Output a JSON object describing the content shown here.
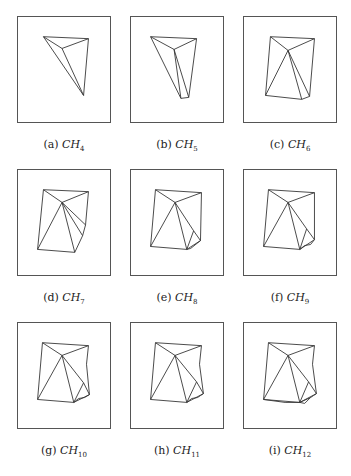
{
  "figure": {
    "panels": [
      {
        "label": "(a)",
        "symbol": "CH",
        "sub": "4",
        "vertices": [
          [
            26,
            20
          ],
          [
            72,
            22
          ],
          [
            45,
            32
          ],
          [
            67,
            80
          ]
        ],
        "edges": [
          [
            0,
            1
          ],
          [
            0,
            2
          ],
          [
            1,
            2
          ],
          [
            0,
            3
          ],
          [
            2,
            3
          ],
          [
            1,
            3
          ]
        ]
      },
      {
        "label": "(b)",
        "symbol": "CH",
        "sub": "5",
        "vertices": [
          [
            20,
            20
          ],
          [
            67,
            22
          ],
          [
            44,
            33
          ],
          [
            59,
            82
          ],
          [
            51,
            83
          ]
        ],
        "edges": [
          [
            0,
            1
          ],
          [
            0,
            2
          ],
          [
            1,
            2
          ],
          [
            0,
            4
          ],
          [
            2,
            4
          ],
          [
            1,
            3
          ],
          [
            3,
            4
          ],
          [
            2,
            3
          ]
        ]
      },
      {
        "label": "(c)",
        "symbol": "CH",
        "sub": "6",
        "vertices": [
          [
            27,
            20
          ],
          [
            72,
            22
          ],
          [
            45,
            34
          ],
          [
            22,
            80
          ],
          [
            59,
            84
          ],
          [
            67,
            81
          ]
        ],
        "edges": [
          [
            0,
            1
          ],
          [
            0,
            2
          ],
          [
            1,
            2
          ],
          [
            0,
            3
          ],
          [
            2,
            3
          ],
          [
            3,
            4
          ],
          [
            2,
            4
          ],
          [
            1,
            5
          ],
          [
            5,
            4
          ],
          [
            2,
            5
          ]
        ]
      },
      {
        "label": "(d)",
        "symbol": "CH",
        "sub": "7",
        "vertices": [
          [
            26,
            20
          ],
          [
            72,
            22
          ],
          [
            45,
            33
          ],
          [
            20,
            81
          ],
          [
            58,
            84
          ],
          [
            66,
            67
          ],
          [
            69,
            56
          ]
        ],
        "edges": [
          [
            0,
            1
          ],
          [
            0,
            2
          ],
          [
            1,
            2
          ],
          [
            0,
            3
          ],
          [
            2,
            3
          ],
          [
            3,
            4
          ],
          [
            2,
            4
          ],
          [
            1,
            6
          ],
          [
            6,
            5
          ],
          [
            5,
            4
          ],
          [
            2,
            6
          ],
          [
            2,
            5
          ]
        ]
      },
      {
        "label": "(e)",
        "symbol": "CH",
        "sub": "8",
        "vertices": [
          [
            25,
            20
          ],
          [
            72,
            23
          ],
          [
            45,
            33
          ],
          [
            20,
            78
          ],
          [
            57,
            81
          ],
          [
            64,
            62
          ],
          [
            71,
            72
          ],
          [
            61,
            80
          ]
        ],
        "edges": [
          [
            0,
            1
          ],
          [
            0,
            2
          ],
          [
            1,
            2
          ],
          [
            0,
            3
          ],
          [
            2,
            3
          ],
          [
            3,
            4
          ],
          [
            2,
            4
          ],
          [
            1,
            6
          ],
          [
            2,
            5
          ],
          [
            5,
            6
          ],
          [
            5,
            4
          ],
          [
            6,
            7
          ],
          [
            7,
            4
          ],
          [
            4,
            6
          ]
        ]
      },
      {
        "label": "(f)",
        "symbol": "CH",
        "sub": "9",
        "vertices": [
          [
            25,
            20
          ],
          [
            72,
            23
          ],
          [
            45,
            33
          ],
          [
            20,
            78
          ],
          [
            57,
            81
          ],
          [
            64,
            60
          ],
          [
            72,
            71
          ],
          [
            62,
            77
          ],
          [
            68,
            76
          ]
        ],
        "edges": [
          [
            0,
            1
          ],
          [
            0,
            2
          ],
          [
            1,
            2
          ],
          [
            0,
            3
          ],
          [
            2,
            3
          ],
          [
            3,
            4
          ],
          [
            2,
            4
          ],
          [
            1,
            6
          ],
          [
            2,
            5
          ],
          [
            5,
            6
          ],
          [
            5,
            4
          ],
          [
            4,
            7
          ],
          [
            7,
            8
          ],
          [
            8,
            6
          ],
          [
            4,
            6
          ]
        ]
      },
      {
        "label": "(g)",
        "symbol": "CH",
        "sub": "10",
        "vertices": [
          [
            25,
            20
          ],
          [
            72,
            23
          ],
          [
            45,
            33
          ],
          [
            20,
            78
          ],
          [
            57,
            81
          ],
          [
            67,
            61
          ],
          [
            73,
            73
          ],
          [
            62,
            77
          ],
          [
            68,
            76
          ],
          [
            70,
            42
          ]
        ],
        "edges": [
          [
            0,
            1
          ],
          [
            0,
            2
          ],
          [
            1,
            2
          ],
          [
            0,
            3
          ],
          [
            2,
            3
          ],
          [
            3,
            4
          ],
          [
            2,
            4
          ],
          [
            1,
            9
          ],
          [
            9,
            6
          ],
          [
            2,
            5
          ],
          [
            5,
            6
          ],
          [
            5,
            4
          ],
          [
            4,
            7
          ],
          [
            7,
            8
          ],
          [
            8,
            6
          ],
          [
            4,
            6
          ]
        ]
      },
      {
        "label": "(h)",
        "symbol": "CH",
        "sub": "11",
        "vertices": [
          [
            25,
            20
          ],
          [
            72,
            23
          ],
          [
            45,
            33
          ],
          [
            20,
            78
          ],
          [
            57,
            81
          ],
          [
            67,
            60
          ],
          [
            74,
            72
          ],
          [
            62,
            77
          ],
          [
            68,
            76
          ],
          [
            70,
            42
          ],
          [
            71,
            74
          ]
        ],
        "edges": [
          [
            0,
            1
          ],
          [
            0,
            2
          ],
          [
            1,
            2
          ],
          [
            0,
            3
          ],
          [
            2,
            3
          ],
          [
            3,
            4
          ],
          [
            2,
            4
          ],
          [
            1,
            9
          ],
          [
            9,
            6
          ],
          [
            2,
            5
          ],
          [
            5,
            6
          ],
          [
            5,
            4
          ],
          [
            4,
            7
          ],
          [
            7,
            8
          ],
          [
            8,
            10
          ],
          [
            10,
            6
          ],
          [
            4,
            6
          ]
        ]
      },
      {
        "label": "(i)",
        "symbol": "CH",
        "sub": "12",
        "vertices": [
          [
            25,
            20
          ],
          [
            72,
            23
          ],
          [
            45,
            33
          ],
          [
            20,
            78
          ],
          [
            57,
            81
          ],
          [
            66,
            60
          ],
          [
            74,
            72
          ],
          [
            62,
            82
          ],
          [
            68,
            76
          ],
          [
            70,
            42
          ],
          [
            71,
            74
          ],
          [
            42,
            81
          ]
        ],
        "edges": [
          [
            0,
            1
          ],
          [
            0,
            2
          ],
          [
            1,
            2
          ],
          [
            0,
            3
          ],
          [
            2,
            3
          ],
          [
            3,
            11
          ],
          [
            11,
            4
          ],
          [
            3,
            4
          ],
          [
            2,
            4
          ],
          [
            1,
            9
          ],
          [
            9,
            6
          ],
          [
            2,
            5
          ],
          [
            5,
            6
          ],
          [
            5,
            4
          ],
          [
            4,
            7
          ],
          [
            7,
            8
          ],
          [
            8,
            10
          ],
          [
            10,
            6
          ],
          [
            4,
            6
          ],
          [
            4,
            8
          ]
        ]
      }
    ]
  },
  "colors": {
    "stroke": "#333333",
    "frame": "#555555"
  }
}
